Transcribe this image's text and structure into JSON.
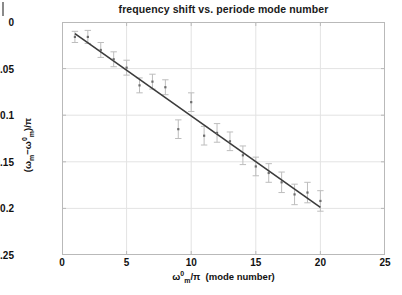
{
  "figure": {
    "title": "frequency shift vs. periode mode number",
    "xlabel_parts": {
      "omega": "ω",
      "sup": "0",
      "sub": "m",
      "over": "/π",
      "tail": "  (mode number)"
    },
    "ylabel_parts": {
      "open": "(",
      "omega": "ω",
      "sub1": "m",
      "minus": "−",
      "omega2": "ω",
      "sup2": "0",
      "sub2": "m",
      "close": ")/π"
    },
    "xlabel_plain": "ω⁰ₘ/π  (mode number)",
    "ylabel_plain": "(ωₘ−ω⁰ₘ)/π",
    "frame_color": "#b9b9b9",
    "grid_color": "#e3e3e3",
    "fit_color": "#3b3b3b",
    "marker_color": "#6d6d6d",
    "errorbar_color": "#bdbdbd",
    "background": "#ffffff"
  },
  "axes": {
    "xticks": [
      "0",
      "5",
      "10",
      "15",
      "20",
      "25"
    ],
    "xtick_values": [
      0,
      5,
      10,
      15,
      20,
      25
    ],
    "yticks": [
      "0",
      "-0.05",
      "-0.1",
      "-0.15",
      "-0.2",
      "-0.25"
    ],
    "ytick_values": [
      0,
      -0.05,
      -0.1,
      -0.15,
      -0.2,
      -0.25
    ]
  },
  "chart_data": {
    "type": "scatter",
    "title": "frequency shift vs. periode mode number",
    "xlabel": "ω⁰ₘ/π  (mode number)",
    "ylabel": "(ωₘ − ω⁰ₘ)/π",
    "xlim": [
      0,
      25
    ],
    "ylim": [
      -0.25,
      0
    ],
    "grid": true,
    "legend": null,
    "series": [
      {
        "name": "measured frequency shift",
        "marker": "point",
        "x": [
          1,
          2,
          3,
          4,
          5,
          6,
          7,
          8,
          9,
          10,
          11,
          12,
          13,
          14,
          15,
          16,
          17,
          18,
          19,
          20
        ],
        "y": [
          -0.016,
          -0.016,
          -0.03,
          -0.04,
          -0.049,
          -0.068,
          -0.064,
          -0.07,
          -0.115,
          -0.086,
          -0.122,
          -0.119,
          -0.128,
          -0.143,
          -0.155,
          -0.162,
          -0.172,
          -0.185,
          -0.183,
          -0.192
        ],
        "yerr": [
          0.006,
          0.007,
          0.008,
          0.008,
          0.008,
          0.008,
          0.008,
          0.008,
          0.01,
          0.01,
          0.01,
          0.01,
          0.01,
          0.01,
          0.01,
          0.01,
          0.011,
          0.011,
          0.011,
          0.011
        ]
      },
      {
        "name": "linear fit",
        "marker": "line",
        "x": [
          1,
          20
        ],
        "y": [
          -0.0125,
          -0.199
        ],
        "slope": -0.00982,
        "intercept": -0.0027
      }
    ]
  }
}
